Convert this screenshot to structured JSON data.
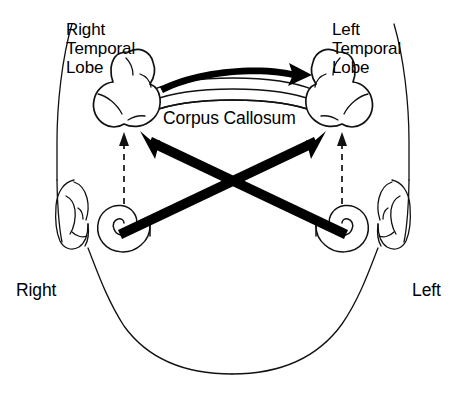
{
  "figure": {
    "view": "axial top-down view of human head",
    "background_color": "#ffffff",
    "ink_color": "#111111"
  },
  "labels": {
    "right_temporal_lobe": "Right\nTemporal\nLobe",
    "left_temporal_lobe": "Left\nTemporal\nLobe",
    "corpus_callosum": "Corpus Callosum",
    "right_side": "Right",
    "left_side": "Left"
  },
  "structures": [
    {
      "name": "head-outline",
      "kind": "outline",
      "description": "head silhouette seen from above"
    },
    {
      "name": "right-temporal-lobe",
      "kind": "brain-region",
      "side": "right"
    },
    {
      "name": "left-temporal-lobe",
      "kind": "brain-region",
      "side": "left"
    },
    {
      "name": "corpus-callosum",
      "kind": "commissure",
      "description": "banded bridge between the two temporal lobes"
    },
    {
      "name": "right-ear-pinna",
      "kind": "outer-ear",
      "side": "right"
    },
    {
      "name": "left-ear-pinna",
      "kind": "outer-ear",
      "side": "left"
    },
    {
      "name": "right-cochlea",
      "kind": "inner-ear-spiral",
      "side": "right"
    },
    {
      "name": "left-cochlea",
      "kind": "inner-ear-spiral",
      "side": "left"
    }
  ],
  "pathways": [
    {
      "name": "contralateral-right-cochlea-to-left-lobe",
      "style": "solid-bold-arrow",
      "from": "right-cochlea",
      "to": "left-temporal-lobe",
      "meaning": "strong crossed (contralateral) auditory projection"
    },
    {
      "name": "contralateral-left-cochlea-to-right-lobe",
      "style": "solid-bold-arrow",
      "from": "left-cochlea",
      "to": "right-temporal-lobe",
      "meaning": "strong crossed (contralateral) auditory projection"
    },
    {
      "name": "ipsilateral-right-cochlea-to-right-lobe",
      "style": "dashed-arrow",
      "from": "right-cochlea",
      "to": "right-temporal-lobe",
      "meaning": "weaker uncrossed (ipsilateral) auditory projection"
    },
    {
      "name": "ipsilateral-left-cochlea-to-left-lobe",
      "style": "dashed-arrow",
      "from": "left-cochlea",
      "to": "left-temporal-lobe",
      "meaning": "weaker uncrossed (ipsilateral) auditory projection"
    },
    {
      "name": "callosal-transfer-right-to-left",
      "style": "curved-bold-arrow",
      "from": "right-temporal-lobe",
      "to": "left-temporal-lobe",
      "meaning": "interhemispheric transfer across the corpus callosum"
    }
  ]
}
